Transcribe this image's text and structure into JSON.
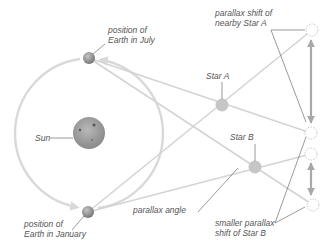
{
  "labels": {
    "earth_july": [
      "position of",
      "Earth in July"
    ],
    "earth_january": [
      "position of",
      "Earth in January"
    ],
    "sun": "Sun",
    "star_a": "Star A",
    "star_b": "Star B",
    "parallax_shift_a": [
      "parallax shift of",
      "nearby Star A"
    ],
    "parallax_shift_b": [
      "smaller parallax",
      "shift of Star B"
    ],
    "parallax_angle": "parallax angle"
  },
  "colors": {
    "orbit": "#d9d9d9",
    "rays": "#d4d4d4",
    "star": "#c6c6c6",
    "shift_arrow": "#a8a8a8",
    "text": "#555555",
    "sun": "#9a9a9a",
    "earth": "#8f8f8f"
  },
  "objects": {
    "sun": {
      "cx": 89,
      "cy": 133,
      "r": 16
    },
    "orbit": {
      "cx": 89,
      "cy": 133,
      "r": 75
    },
    "earth_july": {
      "cx": 89,
      "cy": 58,
      "r": 6
    },
    "earth_january": {
      "cx": 88,
      "cy": 212,
      "r": 6
    },
    "star_a": {
      "cx": 222,
      "cy": 105,
      "r": 6
    },
    "star_b": {
      "cx": 255,
      "cy": 167,
      "r": 6
    },
    "apparent_positions": [
      {
        "name": "star-a-from-january",
        "cx": 312,
        "cy": 30
      },
      {
        "name": "star-a-from-july",
        "cx": 311,
        "cy": 133
      },
      {
        "name": "star-b-from-january",
        "cx": 311,
        "cy": 154
      },
      {
        "name": "star-b-from-july",
        "cx": 313,
        "cy": 205
      }
    ]
  }
}
